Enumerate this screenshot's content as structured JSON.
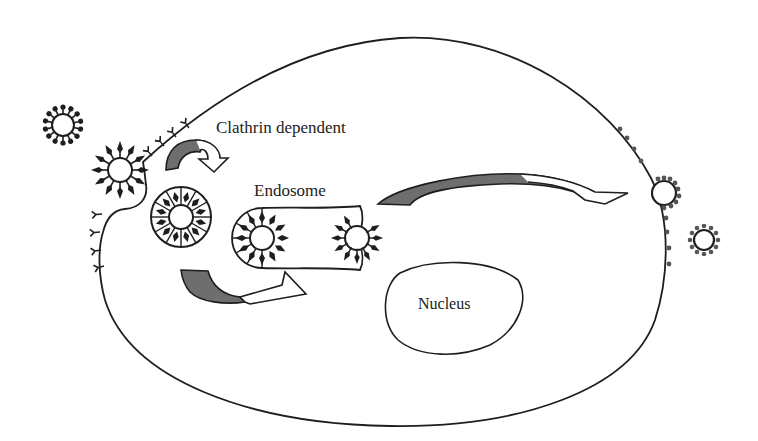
{
  "figure": {
    "type": "schematic diagram of clathrin-dependent endocytosis in a cell",
    "colors": {
      "line": "#1e1e1e",
      "arrow_fill": "#6e6e6e",
      "background": "#ffffff"
    }
  },
  "labels": {
    "clathrin": "Clathrin dependent",
    "endosome": "Endosome",
    "nucleus": "Nucleus"
  },
  "elements": {
    "cell_membrane": "cell-outline",
    "free_virus": "virus-particle-extracellular",
    "entering_virus": "virus-in-clathrin-pit",
    "coated_vesicle": "clathrin-coated-vesicle",
    "endosome": "endosome-with-viruses",
    "budding_virus": "virus-budding-at-membrane",
    "released_virus": "released-virus-particle",
    "arrows": [
      "curved-arrow-to-vesicle",
      "curved-arrow-to-endosome",
      "long-arrow-to-membrane"
    ]
  }
}
